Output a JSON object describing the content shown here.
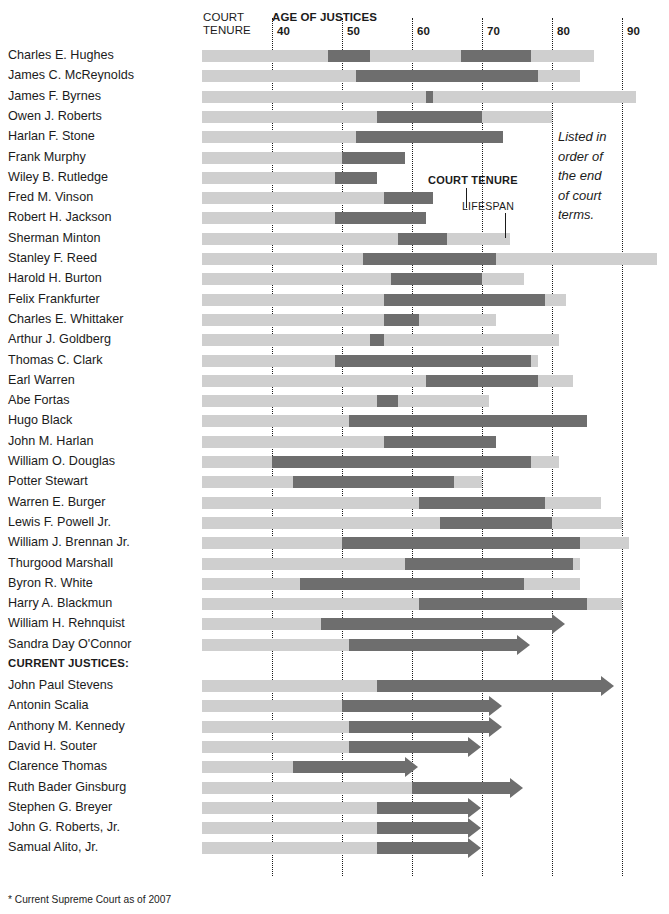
{
  "header": {
    "col_court_tenure": "COURT\nTENURE",
    "axis_title": "AGE OF JUSTICES"
  },
  "annotations": {
    "court_tenure": "COURT TENURE",
    "lifespan": "LIFESPAN",
    "note": "Listed in\norder of\nthe end\nof court\nterms.",
    "current_justices_header": "CURRENT JUSTICES:",
    "footnote": "* Current Supreme Court as of 2007"
  },
  "colors": {
    "lifespan": "#cfcfcf",
    "tenure": "#6e6e6e",
    "text": "#1b1b1b",
    "background": "#ffffff"
  },
  "chart_data": {
    "type": "bar",
    "title": "AGE OF JUSTICES",
    "subtitle": "Supreme Court justices: lifespan and court tenure by age",
    "xlabel": "Age of justices",
    "ylabel": "Justice",
    "xlim": [
      30,
      95
    ],
    "xticks": [
      40,
      50,
      60,
      70,
      80,
      90
    ],
    "xtick_labels": [
      "40",
      "50",
      "60",
      "70",
      "80",
      "90"
    ],
    "grid": true,
    "legend": [
      "COURT TENURE",
      "LIFESPAN"
    ],
    "legend_position": "inline-annotation",
    "series": [
      {
        "name": "LIFESPAN",
        "color": "#cfcfcf"
      },
      {
        "name": "COURT TENURE",
        "color": "#6e6e6e"
      }
    ],
    "sections": [
      {
        "label": "",
        "start_index": 0,
        "count": 28
      },
      {
        "label": "CURRENT JUSTICES:",
        "start_index": 28,
        "count": 9
      }
    ],
    "rows": [
      {
        "name": "Charles E. Hughes",
        "tenure_text": "1910–16, 1930–41",
        "lifespan_start": 30,
        "lifespan_end": 86,
        "tenure_spans": [
          [
            48,
            54
          ],
          [
            67,
            77
          ]
        ],
        "ongoing": false
      },
      {
        "name": "James C. McReynolds",
        "tenure_text": "1914–41",
        "lifespan_start": 30,
        "lifespan_end": 84,
        "tenure_spans": [
          [
            52,
            78
          ]
        ],
        "ongoing": false
      },
      {
        "name": "James F. Byrnes",
        "tenure_text": "1941–42",
        "lifespan_start": 30,
        "lifespan_end": 92,
        "tenure_spans": [
          [
            62,
            63
          ]
        ],
        "ongoing": false
      },
      {
        "name": "Owen J. Roberts",
        "tenure_text": "1930–45",
        "lifespan_start": 30,
        "lifespan_end": 80,
        "tenure_spans": [
          [
            55,
            70
          ]
        ],
        "ongoing": false
      },
      {
        "name": "Harlan F. Stone",
        "tenure_text": "1925–46",
        "lifespan_start": 30,
        "lifespan_end": 73,
        "tenure_spans": [
          [
            52,
            73
          ]
        ],
        "ongoing": false
      },
      {
        "name": "Frank Murphy",
        "tenure_text": "1940–49",
        "lifespan_start": 30,
        "lifespan_end": 59,
        "tenure_spans": [
          [
            50,
            59
          ]
        ],
        "ongoing": false
      },
      {
        "name": "Wiley B. Rutledge",
        "tenure_text": "1943–49",
        "lifespan_start": 30,
        "lifespan_end": 55,
        "tenure_spans": [
          [
            49,
            55
          ]
        ],
        "ongoing": false
      },
      {
        "name": "Fred M. Vinson",
        "tenure_text": "1946–53",
        "lifespan_start": 30,
        "lifespan_end": 63,
        "tenure_spans": [
          [
            56,
            63
          ]
        ],
        "ongoing": false
      },
      {
        "name": "Robert H. Jackson",
        "tenure_text": "1941–54",
        "lifespan_start": 30,
        "lifespan_end": 62,
        "tenure_spans": [
          [
            49,
            62
          ]
        ],
        "ongoing": false
      },
      {
        "name": "Sherman Minton",
        "tenure_text": "1949–56",
        "lifespan_start": 30,
        "lifespan_end": 74,
        "tenure_spans": [
          [
            58,
            65
          ]
        ],
        "ongoing": false
      },
      {
        "name": "Stanley F. Reed",
        "tenure_text": "1938–57",
        "lifespan_start": 30,
        "lifespan_end": 95,
        "tenure_spans": [
          [
            53,
            72
          ]
        ],
        "ongoing": false
      },
      {
        "name": "Harold H. Burton",
        "tenure_text": "1945–58",
        "lifespan_start": 30,
        "lifespan_end": 76,
        "tenure_spans": [
          [
            57,
            70
          ]
        ],
        "ongoing": false
      },
      {
        "name": "Felix Frankfurter",
        "tenure_text": "1939–62",
        "lifespan_start": 30,
        "lifespan_end": 82,
        "tenure_spans": [
          [
            56,
            79
          ]
        ],
        "ongoing": false
      },
      {
        "name": "Charles E. Whittaker",
        "tenure_text": "1957–62",
        "lifespan_start": 30,
        "lifespan_end": 72,
        "tenure_spans": [
          [
            56,
            61
          ]
        ],
        "ongoing": false
      },
      {
        "name": "Arthur J. Goldberg",
        "tenure_text": "1962–65",
        "lifespan_start": 30,
        "lifespan_end": 81,
        "tenure_spans": [
          [
            54,
            56
          ]
        ],
        "ongoing": false
      },
      {
        "name": "Thomas C. Clark",
        "tenure_text": "1949–67",
        "lifespan_start": 30,
        "lifespan_end": 78,
        "tenure_spans": [
          [
            49,
            77
          ]
        ],
        "ongoing": false
      },
      {
        "name": "Earl Warren",
        "tenure_text": "1953–69",
        "lifespan_start": 30,
        "lifespan_end": 83,
        "tenure_spans": [
          [
            62,
            78
          ]
        ],
        "ongoing": false
      },
      {
        "name": "Abe Fortas",
        "tenure_text": "1965–69",
        "lifespan_start": 30,
        "lifespan_end": 71,
        "tenure_spans": [
          [
            55,
            58
          ]
        ],
        "ongoing": false
      },
      {
        "name": "Hugo Black",
        "tenure_text": "1937–71",
        "lifespan_start": 30,
        "lifespan_end": 85,
        "tenure_spans": [
          [
            51,
            85
          ]
        ],
        "ongoing": false
      },
      {
        "name": "John M. Harlan",
        "tenure_text": "1955–71",
        "lifespan_start": 30,
        "lifespan_end": 72,
        "tenure_spans": [
          [
            56,
            72
          ]
        ],
        "ongoing": false
      },
      {
        "name": "William O. Douglas",
        "tenure_text": "1939–75",
        "lifespan_start": 30,
        "lifespan_end": 81,
        "tenure_spans": [
          [
            40,
            77
          ]
        ],
        "ongoing": false
      },
      {
        "name": "Potter Stewart",
        "tenure_text": "1958–81",
        "lifespan_start": 30,
        "lifespan_end": 70,
        "tenure_spans": [
          [
            43,
            66
          ]
        ],
        "ongoing": false
      },
      {
        "name": "Warren E. Burger",
        "tenure_text": "1969–86",
        "lifespan_start": 30,
        "lifespan_end": 87,
        "tenure_spans": [
          [
            61,
            79
          ]
        ],
        "ongoing": false
      },
      {
        "name": "Lewis F. Powell Jr.",
        "tenure_text": "1971–87",
        "lifespan_start": 30,
        "lifespan_end": 90,
        "tenure_spans": [
          [
            64,
            80
          ]
        ],
        "ongoing": false
      },
      {
        "name": "William J. Brennan Jr.",
        "tenure_text": "1956–90",
        "lifespan_start": 30,
        "lifespan_end": 91,
        "tenure_spans": [
          [
            50,
            84
          ]
        ],
        "ongoing": false
      },
      {
        "name": "Thurgood Marshall",
        "tenure_text": "1967–91",
        "lifespan_start": 30,
        "lifespan_end": 84,
        "tenure_spans": [
          [
            59,
            83
          ]
        ],
        "ongoing": false
      },
      {
        "name": "Byron R. White",
        "tenure_text": "1962–93",
        "lifespan_start": 30,
        "lifespan_end": 84,
        "tenure_spans": [
          [
            44,
            76
          ]
        ],
        "ongoing": false
      },
      {
        "name": "Harry A. Blackmun",
        "tenure_text": "1970–94",
        "lifespan_start": 30,
        "lifespan_end": 90,
        "tenure_spans": [
          [
            61,
            85
          ]
        ],
        "ongoing": false
      },
      {
        "name": "William H. Rehnquist",
        "tenure_text": "1971–2005",
        "lifespan_start": 30,
        "lifespan_end": 47,
        "tenure_spans": [
          [
            47,
            80
          ]
        ],
        "ongoing": true
      },
      {
        "name": "Sandra Day O'Connor",
        "tenure_text": "1981–",
        "lifespan_start": 30,
        "lifespan_end": 51,
        "tenure_spans": [
          [
            51,
            75
          ]
        ],
        "ongoing": true
      }
    ],
    "current_rows": [
      {
        "name": "John Paul Stevens",
        "tenure_text": "1975–",
        "lifespan_start": 30,
        "lifespan_end": 55,
        "tenure_spans": [
          [
            55,
            87
          ]
        ],
        "ongoing": true
      },
      {
        "name": "Antonin Scalia",
        "tenure_text": "1986–",
        "lifespan_start": 30,
        "lifespan_end": 50,
        "tenure_spans": [
          [
            50,
            71
          ]
        ],
        "ongoing": true
      },
      {
        "name": "Anthony M. Kennedy",
        "tenure_text": "1988–",
        "lifespan_start": 30,
        "lifespan_end": 51,
        "tenure_spans": [
          [
            51,
            71
          ]
        ],
        "ongoing": true
      },
      {
        "name": "David H. Souter",
        "tenure_text": "1990–",
        "lifespan_start": 30,
        "lifespan_end": 51,
        "tenure_spans": [
          [
            51,
            68
          ]
        ],
        "ongoing": true
      },
      {
        "name": "Clarence Thomas",
        "tenure_text": "1991–",
        "lifespan_start": 30,
        "lifespan_end": 43,
        "tenure_spans": [
          [
            43,
            59
          ]
        ],
        "ongoing": true
      },
      {
        "name": "Ruth Bader Ginsburg",
        "tenure_text": "1993–",
        "lifespan_start": 30,
        "lifespan_end": 60,
        "tenure_spans": [
          [
            60,
            74
          ]
        ],
        "ongoing": true
      },
      {
        "name": "Stephen G. Breyer",
        "tenure_text": "1994–",
        "lifespan_start": 30,
        "lifespan_end": 55,
        "tenure_spans": [
          [
            55,
            68
          ]
        ],
        "ongoing": true
      },
      {
        "name": "John G. Roberts, Jr.",
        "tenure_text": "1994–",
        "lifespan_start": 30,
        "lifespan_end": 55,
        "tenure_spans": [
          [
            55,
            68
          ]
        ],
        "ongoing": true
      },
      {
        "name": "Samual Alito, Jr.",
        "tenure_text": "1994–",
        "lifespan_start": 30,
        "lifespan_end": 55,
        "tenure_spans": [
          [
            55,
            68
          ]
        ],
        "ongoing": true
      }
    ]
  }
}
